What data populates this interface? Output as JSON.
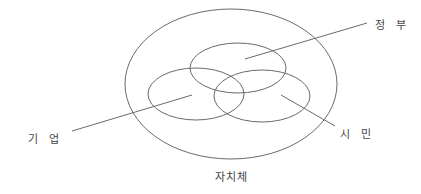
{
  "diagram": {
    "type": "venn",
    "container": {
      "label": "자치체"
    },
    "sets": [
      {
        "id": "government",
        "label": "정 부"
      },
      {
        "id": "business",
        "label": "기 업"
      },
      {
        "id": "citizens",
        "label": "시 민"
      }
    ]
  },
  "colors": {
    "stroke": "#6a6a6a",
    "text": "#444444",
    "background": "#ffffff"
  }
}
